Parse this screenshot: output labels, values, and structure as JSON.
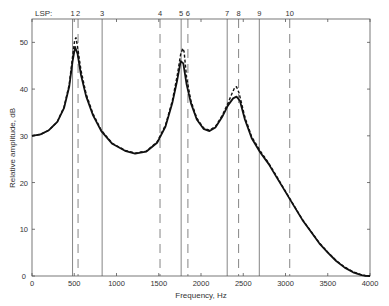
{
  "chart_data": {
    "type": "line",
    "title": "",
    "xlabel": "Frequency, Hz",
    "ylabel": "Relative amplitude, dB",
    "xlim": [
      0,
      4000
    ],
    "ylim": [
      0,
      55
    ],
    "xticks": [
      0,
      500,
      1000,
      1500,
      2000,
      2500,
      3000,
      3500,
      4000
    ],
    "yticks": [
      0,
      10,
      20,
      30,
      40,
      50
    ],
    "grid": false,
    "legend": null,
    "top_axis_label": "LSP:",
    "lsp_lines": [
      {
        "label": "1",
        "freq": 480,
        "style": "solid"
      },
      {
        "label": "2",
        "freq": 545,
        "style": "dashed"
      },
      {
        "label": "3",
        "freq": 830,
        "style": "solid"
      },
      {
        "label": "4",
        "freq": 1515,
        "style": "dashed"
      },
      {
        "label": "5",
        "freq": 1765,
        "style": "solid"
      },
      {
        "label": "6",
        "freq": 1845,
        "style": "dashed"
      },
      {
        "label": "7",
        "freq": 2310,
        "style": "solid"
      },
      {
        "label": "8",
        "freq": 2445,
        "style": "dashed"
      },
      {
        "label": "9",
        "freq": 2690,
        "style": "solid"
      },
      {
        "label": "10",
        "freq": 3050,
        "style": "dashed"
      }
    ],
    "series": [
      {
        "name": "solid",
        "style": "solid",
        "x": [
          0,
          100,
          200,
          300,
          380,
          440,
          480,
          510,
          540,
          580,
          640,
          720,
          820,
          950,
          1100,
          1220,
          1350,
          1480,
          1580,
          1660,
          1720,
          1760,
          1790,
          1830,
          1880,
          1950,
          2030,
          2100,
          2170,
          2250,
          2320,
          2380,
          2420,
          2460,
          2520,
          2600,
          2700,
          2800,
          2900,
          3000,
          3100,
          3200,
          3300,
          3400,
          3500,
          3600,
          3700,
          3800,
          3900,
          3950,
          4000
        ],
        "y": [
          30,
          30.3,
          31.2,
          33,
          36,
          40.5,
          46,
          49,
          47.5,
          43,
          38.5,
          34.5,
          31,
          28.3,
          26.8,
          26.2,
          26.6,
          28.5,
          32,
          37,
          42,
          46,
          45.5,
          41,
          37,
          33.5,
          31.5,
          31,
          31.8,
          34,
          36.5,
          38,
          38.4,
          37.5,
          33.5,
          29.5,
          26.5,
          24,
          21,
          18,
          15,
          12,
          9.5,
          7,
          5,
          3.2,
          1.8,
          0.8,
          0.2,
          0.05,
          0
        ]
      },
      {
        "name": "dashed",
        "style": "dashed",
        "x": [
          0,
          100,
          200,
          300,
          380,
          440,
          480,
          505,
          520,
          540,
          580,
          640,
          720,
          820,
          950,
          1100,
          1220,
          1350,
          1480,
          1580,
          1660,
          1720,
          1760,
          1785,
          1800,
          1830,
          1880,
          1950,
          2030,
          2100,
          2170,
          2250,
          2320,
          2370,
          2400,
          2420,
          2450,
          2520,
          2600,
          2700,
          2800,
          2900,
          3000,
          3100,
          3200,
          3300,
          3400,
          3500,
          3600,
          3700,
          3800,
          3900,
          3950,
          4000
        ],
        "y": [
          30,
          30.3,
          31.2,
          33,
          36.2,
          41,
          47,
          50.5,
          51,
          49,
          44,
          39,
          34.8,
          31.2,
          28.4,
          26.9,
          26.3,
          26.7,
          28.7,
          32.3,
          37.5,
          43,
          47.5,
          48.7,
          48,
          42.5,
          37.5,
          33.8,
          31.7,
          31.2,
          32,
          34.3,
          37,
          39.2,
          40.4,
          40.5,
          39.2,
          34,
          29.8,
          26.8,
          24.2,
          21.2,
          18.1,
          15.1,
          12.1,
          9.6,
          7.1,
          5.1,
          3.3,
          1.9,
          0.9,
          0.25,
          0.05,
          0
        ]
      }
    ]
  }
}
